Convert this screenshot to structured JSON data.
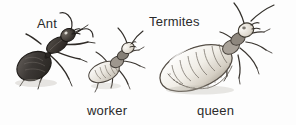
{
  "figure": {
    "kind": "natural-history-illustration",
    "background_color": "#fdfdfd",
    "ink_color": "#2b2b2b",
    "labels": {
      "ant": "Ant",
      "termites": "Termites",
      "worker": "worker",
      "queen": "queen"
    },
    "specimens": [
      {
        "id": "ant",
        "label": "Ant",
        "caste": "",
        "tone": "dark",
        "body_fill": "#3a3734",
        "orientation": "head upper-right, gaster lower-left",
        "antennae": "elbowed",
        "waist": "narrow petiole",
        "legs": 6
      },
      {
        "id": "worker-termite",
        "label": "worker",
        "caste": "worker",
        "tone": "pale",
        "body_fill": "#ece8e1",
        "orientation": "head upper-right, abdomen lower-left",
        "antennae": "straight beaded",
        "waist": "broad",
        "legs": 6
      },
      {
        "id": "queen-termite",
        "label": "queen",
        "caste": "queen",
        "tone": "pale swollen",
        "body_fill": "#f2efe9",
        "orientation": "head upper-right, physogastric abdomen lower-left",
        "antennae": "straight beaded",
        "waist": "broad",
        "legs": 6
      }
    ]
  }
}
